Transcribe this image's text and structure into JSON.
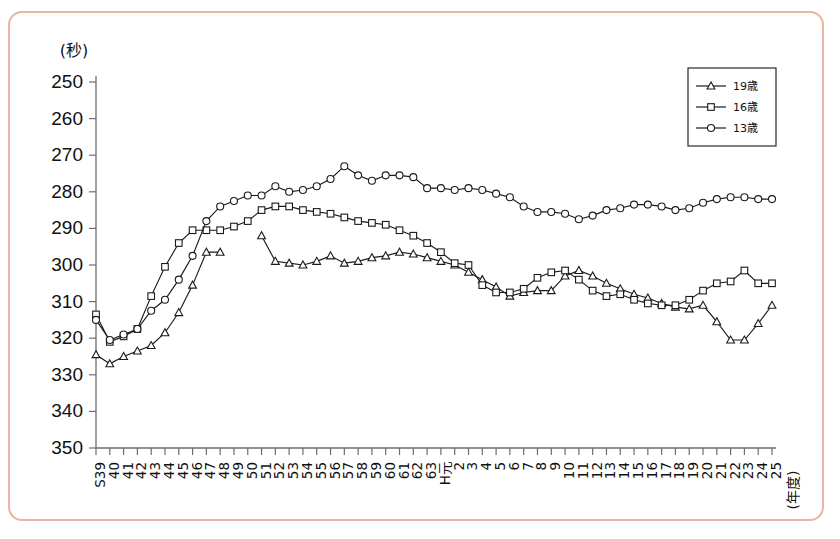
{
  "figure": {
    "y_unit_label": "(秒)",
    "x_axis_label": "(年度)",
    "frame_color": "#e8b79e",
    "background": "#ffffff",
    "line_color": "#1a1a1a"
  },
  "legend": {
    "position": "top-right",
    "entries": [
      {
        "label": "19歳",
        "marker": "triangle"
      },
      {
        "label": "16歳",
        "marker": "square"
      },
      {
        "label": "13歳",
        "marker": "circle"
      }
    ]
  },
  "chart_data": {
    "type": "line",
    "title": "",
    "subtitle": "",
    "xlabel": "(年度)",
    "ylabel": "(秒)",
    "ylim": [
      250,
      350
    ],
    "y_inverted": true,
    "yticks": [
      250,
      260,
      270,
      280,
      290,
      300,
      310,
      320,
      330,
      340,
      350
    ],
    "ytick_labels": [
      "250",
      "260",
      "270",
      "280",
      "290",
      "300",
      "310",
      "320",
      "330",
      "340",
      "350"
    ],
    "grid": false,
    "legend_position": "top-right",
    "categories": [
      "S39",
      "40",
      "41",
      "42",
      "43",
      "44",
      "45",
      "46",
      "47",
      "48",
      "49",
      "50",
      "51",
      "52",
      "53",
      "54",
      "55",
      "56",
      "57",
      "58",
      "59",
      "60",
      "61",
      "62",
      "63",
      "H元",
      "2",
      "3",
      "4",
      "5",
      "6",
      "7",
      "8",
      "9",
      "10",
      "11",
      "12",
      "13",
      "14",
      "15",
      "16",
      "17",
      "18",
      "19",
      "20",
      "21",
      "22",
      "23",
      "24",
      "25"
    ],
    "series": [
      {
        "name": "19歳",
        "marker": "triangle",
        "values": [
          324.5,
          327.0,
          325.0,
          323.5,
          322.0,
          318.5,
          313.0,
          305.5,
          296.5,
          296.5,
          null,
          null,
          292.0,
          299.0,
          299.5,
          300.0,
          299.0,
          297.5,
          299.5,
          299.0,
          298.0,
          297.5,
          296.5,
          297.0,
          298.0,
          299.0,
          300.0,
          302.0,
          304.0,
          306.0,
          308.5,
          307.5,
          307.0,
          307.0,
          303.0,
          301.5,
          303.0,
          305.0,
          306.5,
          308.0,
          309.0,
          310.5,
          311.5,
          312.0,
          311.0,
          315.5,
          320.5,
          320.5,
          316.0,
          311.0
        ]
      },
      {
        "name": "16歳",
        "marker": "square",
        "values": [
          313.5,
          321.0,
          319.5,
          317.5,
          308.5,
          300.5,
          294.0,
          290.5,
          290.5,
          290.5,
          289.5,
          288.0,
          285.0,
          284.0,
          284.0,
          285.0,
          285.5,
          286.0,
          287.0,
          288.0,
          288.5,
          289.0,
          290.5,
          292.0,
          294.0,
          296.5,
          299.5,
          300.0,
          305.5,
          307.5,
          307.5,
          306.5,
          303.5,
          302.0,
          301.5,
          304.0,
          307.0,
          308.5,
          308.0,
          309.5,
          310.5,
          311.0,
          311.0,
          309.5,
          307.0,
          305.0,
          304.5,
          301.5,
          305.0,
          305.0
        ]
      },
      {
        "name": "13歳",
        "marker": "circle",
        "values": [
          315.0,
          320.5,
          319.0,
          317.5,
          312.5,
          309.5,
          304.0,
          297.5,
          288.0,
          284.0,
          282.5,
          281.0,
          281.0,
          278.5,
          280.0,
          279.5,
          278.5,
          276.5,
          273.0,
          275.5,
          277.0,
          275.5,
          275.5,
          276.0,
          279.0,
          279.0,
          279.5,
          279.0,
          279.5,
          280.5,
          281.5,
          284.0,
          285.5,
          285.5,
          286.0,
          287.5,
          286.5,
          285.0,
          284.5,
          283.5,
          283.5,
          284.0,
          285.0,
          284.5,
          283.0,
          282.0,
          281.5,
          281.5,
          282.0,
          282.0
        ]
      }
    ]
  }
}
